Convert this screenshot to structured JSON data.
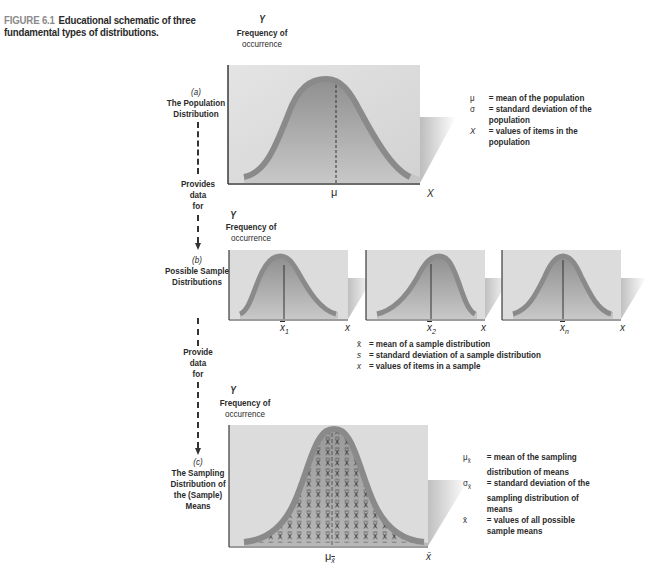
{
  "caption": {
    "figure_label": "FIGURE 6.1",
    "text": "Educational schematic of three fundamental types of distributions."
  },
  "panel_a": {
    "letter": "(a)",
    "title_line1": "The Population",
    "title_line2": "Distribution",
    "y_axis": "Y",
    "y_label_line1": "Frequency of",
    "y_label_line2": "occurrence",
    "x_axis": "X",
    "center_label": "μ",
    "legend": [
      {
        "symbol": "μ",
        "line1": "= mean of the population",
        "line2": ""
      },
      {
        "symbol": "σ",
        "line1": "= standard deviation of the",
        "line2": "population"
      },
      {
        "symbol": "X",
        "line1": "= values of items in the",
        "line2": "population"
      }
    ]
  },
  "connector_1": {
    "line1": "Provides",
    "line2": "data",
    "line3": "for"
  },
  "panel_b": {
    "letter": "(b)",
    "title_line1": "Possible Sample",
    "title_line2": "Distributions",
    "y_axis": "Y",
    "y_label_line1": "Frequency of",
    "y_label_line2": "occurrence",
    "x_axis": "x",
    "samples": [
      {
        "mean_label": "x",
        "subscript": "1"
      },
      {
        "mean_label": "x",
        "subscript": "2"
      },
      {
        "mean_label": "x",
        "subscript": "n"
      }
    ],
    "legend": [
      {
        "symbol": "x̄",
        "text": "= mean of a sample distribution"
      },
      {
        "symbol": "s",
        "text": "= standard deviation of a sample distribution"
      },
      {
        "symbol": "x",
        "text": "= values of items in a sample"
      }
    ]
  },
  "connector_2": {
    "line1": "Provide",
    "line2": "data",
    "line3": "for"
  },
  "panel_c": {
    "letter": "(c)",
    "title_line1": "The Sampling",
    "title_line2": "Distribution of",
    "title_line3": "the (Sample)",
    "title_line4": "Means",
    "y_axis": "Y",
    "y_label_line1": "Frequency of",
    "y_label_line2": "occurrence",
    "x_axis": "x̄",
    "center_label": "μ",
    "center_sub": "x̄",
    "cell_glyph": "x̄",
    "legend": [
      {
        "symbol": "μ",
        "sub": "x̄",
        "line1": "= mean of the sampling",
        "line2": "distribution of means",
        "line3": ""
      },
      {
        "symbol": "σ",
        "sub": "x̄",
        "line1": "= standard deviation of the",
        "line2": "sampling distribution of",
        "line3": "means"
      },
      {
        "symbol": "x̄",
        "sub": "",
        "line1": "= values of all possible",
        "line2": "sample means",
        "line3": ""
      }
    ]
  },
  "colors": {
    "panel_bg": "#dcdcdc",
    "curve_stroke": "#8c8c8c",
    "fill_dark": "#8f8f8f",
    "fill_light": "#c4c4c4",
    "axis": "#3a3a3a",
    "caption_gray": "#8a8a8a"
  }
}
